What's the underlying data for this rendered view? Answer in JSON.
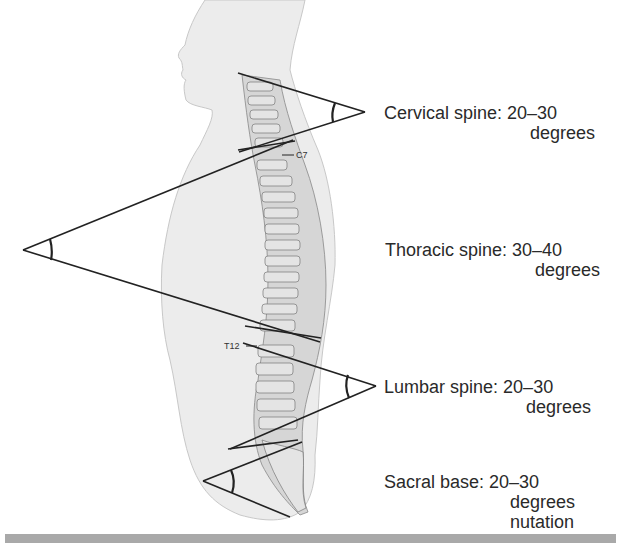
{
  "figure": {
    "regions": [
      {
        "id": "cervical",
        "label": "Cervical spine:",
        "value": "20–30",
        "unit": "degrees",
        "extra": ""
      },
      {
        "id": "thoracic",
        "label": "Thoracic spine:",
        "value": "30–40",
        "unit": "degrees",
        "extra": ""
      },
      {
        "id": "lumbar",
        "label": "Lumbar spine:",
        "value": "20–30",
        "unit": "degrees",
        "extra": ""
      },
      {
        "id": "sacral",
        "label": "Sacral base:",
        "value": "20–30",
        "unit": "degrees",
        "extra": "nutation"
      }
    ],
    "vertebra_markers": {
      "c7": "C7",
      "t12": "T12"
    },
    "colors": {
      "body_fill": "#ececec",
      "body_outline": "#c8c8c8",
      "spine_fill": "#d6d6d6",
      "line": "#222222",
      "bar": "#a9a9a9"
    }
  }
}
